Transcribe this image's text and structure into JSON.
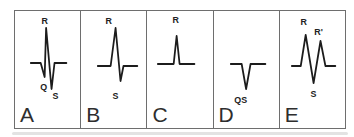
{
  "figure": {
    "description_labels": {
      "panel_count": "5"
    },
    "colors": {
      "trace": "#1c1c1c",
      "border": "#6e6e6e",
      "wave_label": "#222222",
      "panel_letter": "#2e2e2e",
      "background": "#ffffff"
    },
    "panels": [
      {
        "letter": "A",
        "points": "16,52 26,52 30,66 31.5,17 37,78 40,52 52,52",
        "labels": {
          "r": "R",
          "q": "Q",
          "s": "S"
        }
      },
      {
        "letter": "B",
        "points": "17,55 30,55 35,17 40,70 43,55 57,55",
        "labels": {
          "r": "R",
          "s": "S"
        }
      },
      {
        "letter": "C",
        "points": "11,53 27,53 30,25 33,53 48,53",
        "labels": {
          "r": "R"
        }
      },
      {
        "letter": "D",
        "points": "17,53 28,53 32.5,78 37,53 52,53",
        "labels": {
          "qs": "QS"
        }
      },
      {
        "letter": "E",
        "points": "12,55 21,55 26,24 34,72 41,30 46,55 56,55",
        "labels": {
          "r": "R",
          "r_prime": "R'",
          "s": "S"
        }
      }
    ]
  }
}
